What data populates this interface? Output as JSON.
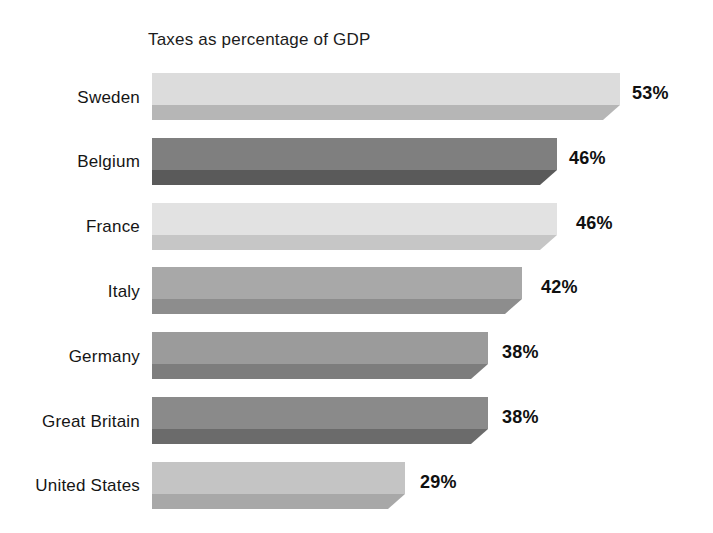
{
  "chart_data": {
    "type": "bar",
    "orientation": "horizontal",
    "style": "3d-extruded-bars",
    "title": "Taxes as percentage of GDP",
    "xlabel": "",
    "ylabel": "",
    "units": "percent",
    "grid": false,
    "legend": false,
    "axis_visible": false,
    "xlim": [
      0,
      60
    ],
    "categories": [
      "Sweden",
      "Belgium",
      "France",
      "Italy",
      "Germany",
      "Great Britain",
      "United States"
    ],
    "values": [
      53,
      46,
      46,
      42,
      38,
      38,
      29
    ],
    "data_labels": [
      "53%",
      "46%",
      "46%",
      "42%",
      "38%",
      "38%",
      "29%"
    ],
    "bar_colors_top": [
      "#dcdcdc",
      "#7f7f7f",
      "#e2e2e2",
      "#a8a8a8",
      "#9b9b9b",
      "#8a8a8a",
      "#c4c4c4"
    ],
    "bar_colors_front": [
      "#b6b6b6",
      "#5a5a5a",
      "#c6c6c6",
      "#8d8d8d",
      "#7d7d7d",
      "#6b6b6b",
      "#a8a8a8"
    ]
  },
  "chart": {
    "title": "Taxes as percentage of GDP",
    "background_color": "#ffffff",
    "text_color": "#151515",
    "bars": [
      {
        "label": "Sweden",
        "value": 53,
        "value_label": "53%",
        "color_top": "#dcdcdc",
        "color_front": "#b6b6b6",
        "bar_end_x": 620,
        "label_x": 632
      },
      {
        "label": "Belgium",
        "value": 46,
        "value_label": "46%",
        "color_top": "#7f7f7f",
        "color_front": "#5a5a5a",
        "bar_end_x": 557,
        "label_x": 569
      },
      {
        "label": "France",
        "value": 46,
        "value_label": "46%",
        "color_top": "#e2e2e2",
        "color_front": "#c6c6c6",
        "bar_end_x": 557,
        "label_x": 576
      },
      {
        "label": "Italy",
        "value": 42,
        "value_label": "42%",
        "color_top": "#a8a8a8",
        "color_front": "#8d8d8d",
        "bar_end_x": 522,
        "label_x": 541
      },
      {
        "label": "Germany",
        "value": 38,
        "value_label": "38%",
        "color_top": "#9b9b9b",
        "color_front": "#7d7d7d",
        "bar_end_x": 488,
        "label_x": 502
      },
      {
        "label": "Great Britain",
        "value": 38,
        "value_label": "38%",
        "color_top": "#8a8a8a",
        "color_front": "#6b6b6b",
        "bar_end_x": 488,
        "label_x": 502
      },
      {
        "label": "United States",
        "value": 29,
        "value_label": "29%",
        "color_top": "#c4c4c4",
        "color_front": "#a8a8a8",
        "bar_end_x": 405,
        "label_x": 420
      }
    ]
  }
}
